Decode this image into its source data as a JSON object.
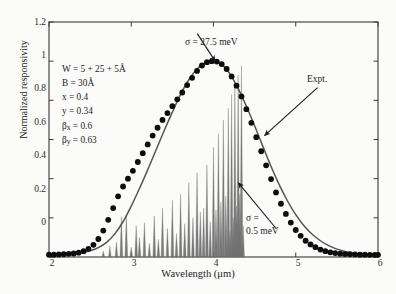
{
  "figure": {
    "background": "#fbfbfa",
    "frame_color": "#3a3a3a"
  },
  "chart_data": {
    "type": "line",
    "title": "",
    "xlabel": "Wavelength (μm)",
    "ylabel": "Normalized responsivity",
    "xlim": [
      2,
      6
    ],
    "ylim": [
      0,
      1.2
    ],
    "xticks": [
      2,
      3,
      4,
      5,
      6
    ],
    "xtick_labels": [
      "2",
      "3",
      "4",
      "5",
      "6"
    ],
    "yticks": [
      0,
      0.2,
      0.4,
      0.6,
      0.8,
      1,
      1.2
    ],
    "ytick_labels": [
      "0",
      "0.2",
      "0.4",
      "0.6",
      "0.8",
      "1",
      "1.2"
    ],
    "grid": false,
    "legend_position": "none",
    "series": [
      {
        "name": "Theory (σ = 27.5 meV)",
        "style": "solid-line",
        "color": "#555555",
        "x": [
          2.0,
          2.1,
          2.2,
          2.3,
          2.4,
          2.5,
          2.6,
          2.7,
          2.8,
          2.9,
          3.0,
          3.1,
          3.2,
          3.3,
          3.4,
          3.5,
          3.6,
          3.7,
          3.8,
          3.9,
          4.0,
          4.05,
          4.1,
          4.2,
          4.3,
          4.4,
          4.5,
          4.6,
          4.7,
          4.8,
          4.9,
          5.0,
          5.1,
          5.2,
          5.3,
          5.4,
          5.5,
          5.6,
          5.7,
          5.8,
          5.9,
          6.0
        ],
        "y": [
          0.008,
          0.01,
          0.013,
          0.017,
          0.023,
          0.032,
          0.048,
          0.075,
          0.118,
          0.18,
          0.26,
          0.35,
          0.445,
          0.545,
          0.645,
          0.74,
          0.83,
          0.905,
          0.96,
          0.992,
          1.0,
          0.998,
          0.985,
          0.935,
          0.86,
          0.77,
          0.67,
          0.565,
          0.462,
          0.368,
          0.286,
          0.216,
          0.16,
          0.116,
          0.083,
          0.058,
          0.04,
          0.028,
          0.019,
          0.014,
          0.01,
          0.008
        ]
      },
      {
        "name": "Expt.",
        "style": "filled-circles",
        "color": "#0d0d0d",
        "x": [
          2.0,
          2.06,
          2.12,
          2.18,
          2.24,
          2.3,
          2.36,
          2.42,
          2.48,
          2.54,
          2.6,
          2.66,
          2.72,
          2.78,
          2.84,
          2.9,
          2.96,
          3.02,
          3.08,
          3.14,
          3.2,
          3.26,
          3.32,
          3.38,
          3.44,
          3.5,
          3.56,
          3.62,
          3.68,
          3.74,
          3.8,
          3.86,
          3.92,
          3.98,
          4.04,
          4.1,
          4.16,
          4.22,
          4.28,
          4.34,
          4.4,
          4.46,
          4.52,
          4.58,
          4.64,
          4.7,
          4.76,
          4.82,
          4.88,
          4.94,
          5.0,
          5.06,
          5.12,
          5.18,
          5.24,
          5.3,
          5.36,
          5.42,
          5.48,
          5.54,
          5.6,
          5.66,
          5.72,
          5.78,
          5.84,
          5.9,
          5.96,
          6.0
        ],
        "y": [
          0.012,
          0.012,
          0.013,
          0.014,
          0.016,
          0.018,
          0.022,
          0.03,
          0.042,
          0.062,
          0.092,
          0.135,
          0.19,
          0.25,
          0.31,
          0.36,
          0.4,
          0.44,
          0.485,
          0.53,
          0.575,
          0.62,
          0.66,
          0.7,
          0.735,
          0.77,
          0.805,
          0.84,
          0.878,
          0.915,
          0.95,
          0.978,
          0.995,
          1.0,
          0.998,
          0.985,
          0.96,
          0.922,
          0.875,
          0.82,
          0.755,
          0.685,
          0.612,
          0.54,
          0.468,
          0.398,
          0.33,
          0.272,
          0.22,
          0.176,
          0.138,
          0.108,
          0.083,
          0.064,
          0.05,
          0.038,
          0.03,
          0.024,
          0.02,
          0.017,
          0.015,
          0.014,
          0.013,
          0.012,
          0.012,
          0.011,
          0.011,
          0.011
        ]
      },
      {
        "name": "Theory (σ = 0.5 meV)",
        "style": "spikes",
        "color": "#6e6e6e",
        "x": [
          2.66,
          2.74,
          2.82,
          2.88,
          2.94,
          3.0,
          3.06,
          3.1,
          3.16,
          3.22,
          3.28,
          3.33,
          3.38,
          3.44,
          3.5,
          3.55,
          3.6,
          3.65,
          3.7,
          3.75,
          3.8,
          3.84,
          3.88,
          3.92,
          3.96,
          4.0,
          4.03,
          4.06,
          4.09,
          4.12,
          4.15,
          4.18,
          4.2,
          4.22,
          4.24,
          4.26,
          4.28,
          4.3,
          4.32,
          4.34,
          4.36
        ],
        "y": [
          0.03,
          0.055,
          0.075,
          0.205,
          0.215,
          0.05,
          0.16,
          0.1,
          0.175,
          0.07,
          0.21,
          0.09,
          0.25,
          0.145,
          0.29,
          0.12,
          0.32,
          0.17,
          0.38,
          0.2,
          0.43,
          0.23,
          0.25,
          0.47,
          0.18,
          0.56,
          0.24,
          0.63,
          0.28,
          0.7,
          0.31,
          0.76,
          0.13,
          0.83,
          0.2,
          0.88,
          0.26,
          0.93,
          0.32,
          0.975,
          0.16
        ]
      }
    ],
    "annotations": [
      {
        "name": "sigma-broadened",
        "text": "σ = 27.5 meV",
        "x": 3.9,
        "y": 1.12,
        "arrow_to": [
          4.02,
          1.0
        ]
      },
      {
        "name": "expt-pointer",
        "text": "Expt.",
        "x": 5.35,
        "y": 0.86,
        "arrow_to": [
          4.62,
          0.62
        ]
      },
      {
        "name": "sigma-narrow-line1",
        "text": "σ =",
        "x": 4.8,
        "y": 0.26
      },
      {
        "name": "sigma-narrow-line2",
        "text": "0.5 meV",
        "x": 4.8,
        "y": 0.18,
        "arrow_to": [
          4.3,
          0.38
        ]
      }
    ],
    "parameters": [
      {
        "symbol": "W",
        "text": "W = 5 + 25 + 5Å"
      },
      {
        "symbol": "B",
        "text": "B = 30Å"
      },
      {
        "symbol": "x",
        "text": "x = 0.4"
      },
      {
        "symbol": "y",
        "text": "y = 0.34"
      },
      {
        "symbol": "beta_x",
        "text": "βₓ = 0.6"
      },
      {
        "symbol": "beta_y",
        "text": "βᵧ = 0.63"
      }
    ]
  },
  "axis": {
    "xlabel": "Wavelength (μm)",
    "ylabel": "Normalized responsivity"
  },
  "labels": {
    "sigma_broad": "σ = 27.5 meV",
    "expt": "Expt.",
    "sigma_narrow_1": "σ =",
    "sigma_narrow_2": "0.5 meV",
    "p_w": "W = 5 + 25 + 5Å",
    "p_b": "B = 30Å",
    "p_x": "x = 0.4",
    "p_y": "y = 0.34",
    "p_bx": "β",
    "p_bx_sub": "x",
    "p_bx_val": " = 0.6",
    "p_by": "β",
    "p_by_sub": "y",
    "p_by_val": " = 0.63"
  },
  "ticks": {
    "x": [
      "2",
      "3",
      "4",
      "5",
      "6"
    ],
    "y": [
      "1.2",
      "1",
      "0.8",
      "0.6",
      "0.4",
      "0.2",
      "0"
    ]
  }
}
